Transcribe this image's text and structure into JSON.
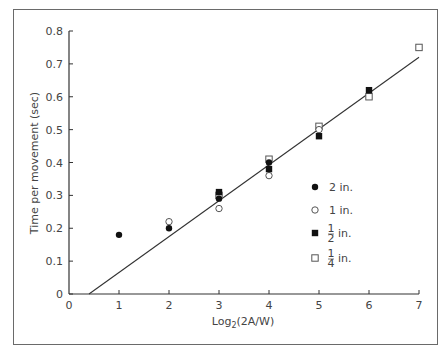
{
  "chart_data": {
    "type": "scatter",
    "title": "",
    "xlabel": "Log2(2A/W)",
    "xlabel_main": "Log",
    "xlabel_sub": "2",
    "xlabel_rest": "(2A/W)",
    "ylabel": "Time per movement (sec)",
    "xlim": [
      0,
      7
    ],
    "ylim": [
      0,
      0.8
    ],
    "xticks": [
      "0",
      "1",
      "2",
      "3",
      "4",
      "5",
      "6",
      "7"
    ],
    "yticks": [
      "0",
      "0.1",
      "0.2",
      "0.3",
      "0.4",
      "0.5",
      "0.6",
      "0.7",
      "0.8"
    ],
    "grid": false,
    "legend_position": "right-center inside",
    "series": [
      {
        "name": "2 in.",
        "marker": "filled-circle",
        "points": [
          [
            1,
            0.18
          ],
          [
            2,
            0.2
          ],
          [
            3,
            0.29
          ],
          [
            4,
            0.4
          ]
        ]
      },
      {
        "name": "1 in.",
        "marker": "open-circle",
        "points": [
          [
            2,
            0.22
          ],
          [
            3,
            0.26
          ],
          [
            4,
            0.36
          ],
          [
            5,
            0.5
          ]
        ]
      },
      {
        "name": "1/2 in.",
        "marker": "filled-square",
        "points": [
          [
            3,
            0.31
          ],
          [
            4,
            0.38
          ],
          [
            5,
            0.48
          ],
          [
            6,
            0.62
          ]
        ]
      },
      {
        "name": "1/4 in.",
        "marker": "open-square",
        "points": [
          [
            3,
            0.3
          ],
          [
            4,
            0.41
          ],
          [
            5,
            0.51
          ],
          [
            6,
            0.6
          ],
          [
            7,
            0.75
          ]
        ]
      }
    ],
    "fit_line": {
      "x": [
        0.4,
        7.0
      ],
      "y": [
        0.0,
        0.72
      ]
    },
    "legend": [
      {
        "label": "2 in.",
        "marker": "filled-circle"
      },
      {
        "label": "1 in.",
        "marker": "open-circle"
      },
      {
        "num": "1",
        "den": "2",
        "unit": "in.",
        "marker": "filled-square"
      },
      {
        "num": "1",
        "den": "4",
        "unit": "in.",
        "marker": "open-square"
      }
    ]
  }
}
